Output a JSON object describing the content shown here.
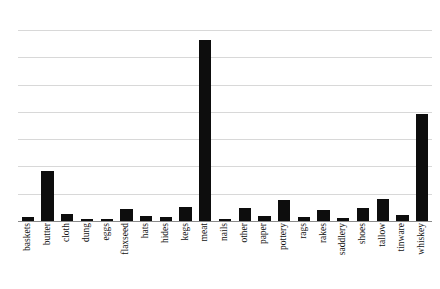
{
  "chart_data": {
    "type": "bar",
    "title": "",
    "subtitle": "",
    "xlabel": "",
    "ylabel": "",
    "legend": [],
    "grid": true,
    "gridlines_count": 7,
    "axis_tick_labels": [],
    "ylim": [
      0,
      7.6
    ],
    "bar_color": "#0d0d0d",
    "gridline_color": "#d8d8d8",
    "axis_color": "#8a8a8a",
    "background_color": "#ffffff",
    "categories": [
      "baskets",
      "butter",
      "cloth",
      "dung",
      "eggs",
      "flaxseed",
      "hats",
      "hides",
      "kegs",
      "meat",
      "nails",
      "other",
      "paper",
      "pottery",
      "rags",
      "rakes",
      "saddlery",
      "shoes",
      "tallow",
      "tinware",
      "whiskey"
    ],
    "values": [
      0.16,
      1.98,
      0.28,
      0.1,
      0.05,
      0.47,
      0.2,
      0.16,
      0.55,
      7.21,
      0.09,
      0.51,
      0.2,
      0.82,
      0.14,
      0.45,
      0.13,
      0.51,
      0.88,
      0.24,
      4.24
    ]
  }
}
